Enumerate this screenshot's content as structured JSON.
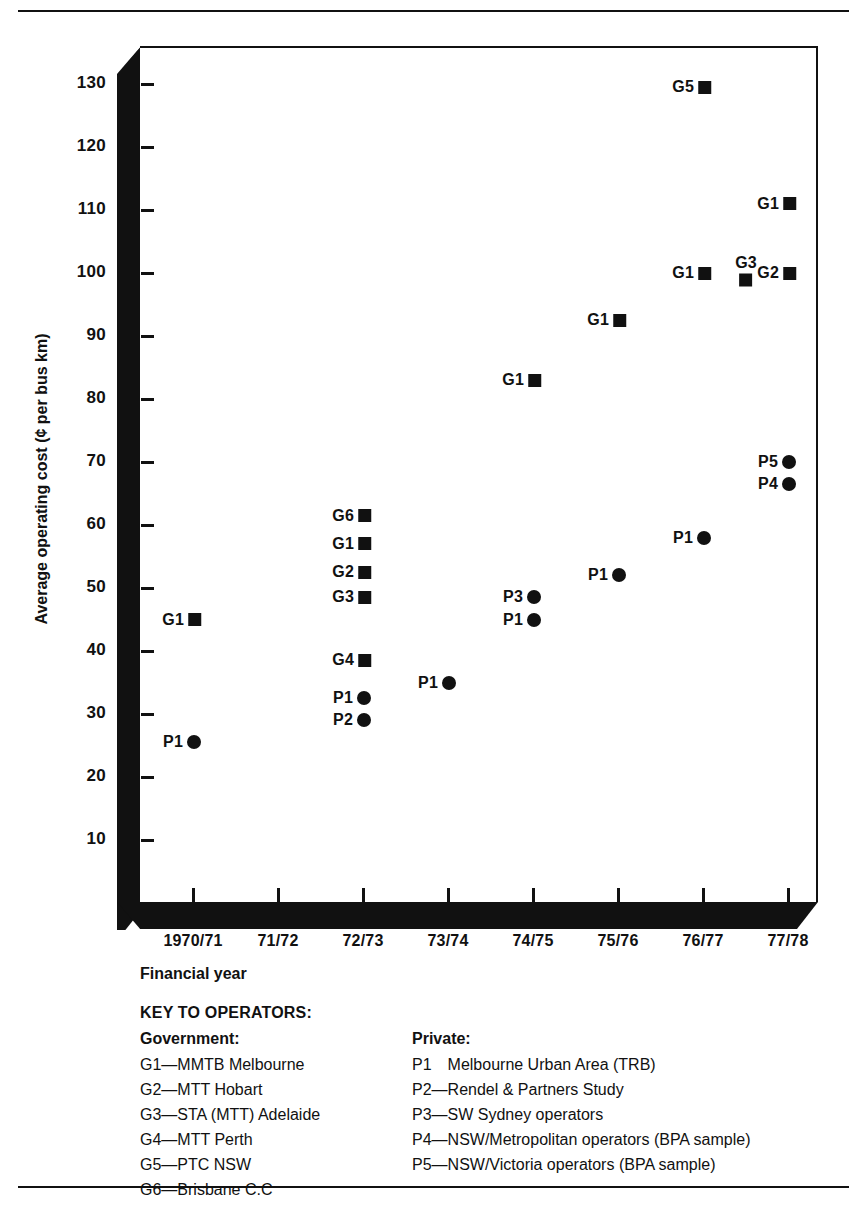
{
  "chart_data": {
    "type": "scatter",
    "title": "",
    "xlabel": "Financial year",
    "ylabel": "Average operating cost (¢ per bus km)",
    "categories": [
      "1970/71",
      "71/72",
      "72/73",
      "73/74",
      "74/75",
      "75/76",
      "76/77",
      "77/78"
    ],
    "ylim": [
      0,
      136
    ],
    "yticks": [
      10,
      20,
      30,
      40,
      50,
      60,
      70,
      80,
      90,
      100,
      110,
      120,
      130
    ],
    "grid": false,
    "legend_position": "below-axes",
    "points": [
      {
        "label": "G1",
        "marker": "square",
        "x": "1970/71",
        "y": 45,
        "label_pos": "left"
      },
      {
        "label": "P1",
        "marker": "circle",
        "x": "1970/71",
        "y": 25.5,
        "label_pos": "left"
      },
      {
        "label": "G6",
        "marker": "square",
        "x": "72/73",
        "y": 61.5,
        "label_pos": "left"
      },
      {
        "label": "G1",
        "marker": "square",
        "x": "72/73",
        "y": 57,
        "label_pos": "left"
      },
      {
        "label": "G2",
        "marker": "square",
        "x": "72/73",
        "y": 52.5,
        "label_pos": "left"
      },
      {
        "label": "G3",
        "marker": "square",
        "x": "72/73",
        "y": 48.5,
        "label_pos": "left"
      },
      {
        "label": "G4",
        "marker": "square",
        "x": "72/73",
        "y": 38.5,
        "label_pos": "left"
      },
      {
        "label": "P1",
        "marker": "circle",
        "x": "72/73",
        "y": 32.5,
        "label_pos": "left"
      },
      {
        "label": "P2",
        "marker": "circle",
        "x": "72/73",
        "y": 29,
        "label_pos": "left"
      },
      {
        "label": "P1",
        "marker": "circle",
        "x": "73/74",
        "y": 35,
        "label_pos": "left"
      },
      {
        "label": "G1",
        "marker": "square",
        "x": "74/75",
        "y": 83,
        "label_pos": "left"
      },
      {
        "label": "P3",
        "marker": "circle",
        "x": "74/75",
        "y": 48.5,
        "label_pos": "left"
      },
      {
        "label": "P1",
        "marker": "circle",
        "x": "74/75",
        "y": 45,
        "label_pos": "left"
      },
      {
        "label": "G1",
        "marker": "square",
        "x": "75/76",
        "y": 92.5,
        "label_pos": "left"
      },
      {
        "label": "P1",
        "marker": "circle",
        "x": "75/76",
        "y": 52,
        "label_pos": "left"
      },
      {
        "label": "G5",
        "marker": "square",
        "x": "76/77",
        "y": 129.5,
        "label_pos": "left"
      },
      {
        "label": "G1",
        "marker": "square",
        "x": "76/77",
        "y": 100,
        "label_pos": "left"
      },
      {
        "label": "P1",
        "marker": "circle",
        "x": "76/77",
        "y": 58,
        "label_pos": "left"
      },
      {
        "label": "G3",
        "marker": "square",
        "x": "77/78",
        "y": 100.5,
        "label_pos": "above",
        "x_offset": -50
      },
      {
        "label": "G1",
        "marker": "square",
        "x": "77/78",
        "y": 111,
        "label_pos": "left"
      },
      {
        "label": "G2",
        "marker": "square",
        "x": "77/78",
        "y": 100,
        "label_pos": "left"
      },
      {
        "label": "P5",
        "marker": "circle",
        "x": "77/78",
        "y": 70,
        "label_pos": "left"
      },
      {
        "label": "P4",
        "marker": "circle",
        "x": "77/78",
        "y": 66.5,
        "label_pos": "left"
      }
    ]
  },
  "key": {
    "title": "KEY TO OPERATORS:",
    "government_heading": "Government:",
    "private_heading": "Private:",
    "government": [
      "G1—MMTB Melbourne",
      "G2—MTT Hobart",
      "G3—STA (MTT) Adelaide",
      "G4—MTT Perth",
      "G5—PTC NSW",
      "G6—Brisbane C.C"
    ],
    "private": [
      "P1 Melbourne Urban Area (TRB)",
      "P2—Rendel & Partners Study",
      "P3—SW Sydney operators",
      "P4—NSW/Metropolitan operators (BPA sample)",
      "P5—NSW/Victoria operators (BPA sample)"
    ]
  },
  "colors": {
    "ink": "#111111",
    "paper": "#ffffff"
  }
}
